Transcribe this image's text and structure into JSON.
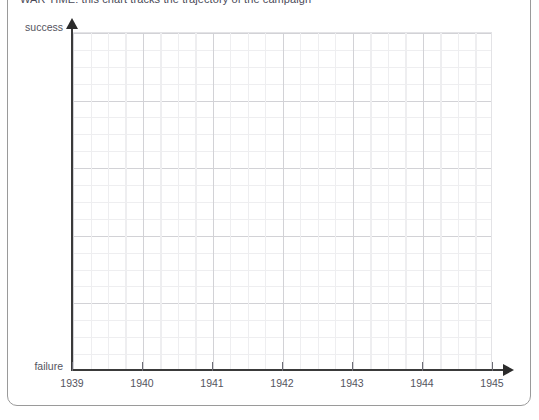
{
  "header": {
    "clipped_line": "WAR TIME: this chart tracks the trajectory of the campaign"
  },
  "chart_data": {
    "type": "line",
    "title": "",
    "xlabel": "",
    "ylabel": "",
    "x_tick_labels": [
      "1939",
      "1940",
      "1941",
      "1942",
      "1943",
      "1944",
      "1945"
    ],
    "x_tick_values": [
      1939,
      1940,
      1941,
      1942,
      1943,
      1944,
      1945
    ],
    "xlim": [
      1939,
      1945
    ],
    "y_axis_endpoints": {
      "bottom": "failure",
      "top": "success"
    },
    "ylim": [
      0,
      1
    ],
    "y_tick_labels": [],
    "grid": true,
    "grid_major_x_per_unit": 1,
    "grid_minor_x_per_major": 4,
    "grid_major_y_count": 5,
    "grid_minor_y_per_major": 4,
    "legend": null,
    "series": [],
    "values": [],
    "annotations": []
  },
  "axes": {
    "y_top_label": "success",
    "y_bottom_label": "failure"
  }
}
